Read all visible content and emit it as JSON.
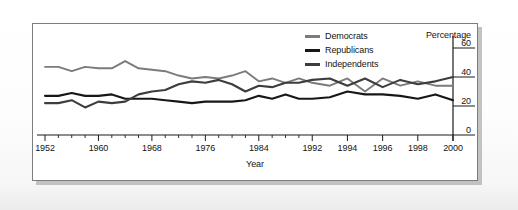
{
  "chart_data": {
    "type": "line",
    "title": "",
    "xlabel": "Year",
    "ylabel": "Percentage",
    "ylim": [
      0,
      60
    ],
    "yticks": [
      0,
      20,
      40,
      60
    ],
    "grid": false,
    "legend_position": "top-center-right",
    "x_tick_labels": [
      "1952",
      "1960",
      "1968",
      "1976",
      "1984",
      "1992",
      "1994",
      "1996",
      "1998",
      "2000"
    ],
    "x_tick_note": "Axis spacing is non-uniform: 8-year steps from 1952 to 1992, then 2-year steps from 1992 to 2000",
    "x": [
      1952,
      1954,
      1956,
      1958,
      1960,
      1962,
      1964,
      1966,
      1968,
      1970,
      1972,
      1974,
      1976,
      1978,
      1980,
      1982,
      1984,
      1986,
      1988,
      1990,
      1992,
      1993,
      1994,
      1995,
      1996,
      1997,
      1998,
      1999,
      2000
    ],
    "series": [
      {
        "name": "Democrats",
        "color": "#7b7b7b",
        "values": [
          47,
          47,
          44,
          47,
          46,
          46,
          51,
          46,
          45,
          44,
          41,
          39,
          40,
          39,
          41,
          44,
          37,
          39,
          36,
          39,
          36,
          34,
          39,
          30,
          39,
          34,
          37,
          34,
          34
        ]
      },
      {
        "name": "Republicans",
        "color": "#171717",
        "values": [
          27,
          27,
          29,
          27,
          27,
          28,
          25,
          25,
          25,
          24,
          23,
          22,
          23,
          23,
          23,
          24,
          27,
          25,
          28,
          25,
          25,
          26,
          30,
          28,
          28,
          27,
          25,
          28,
          24
        ]
      },
      {
        "name": "Independents",
        "color": "#3d3d3d",
        "values": [
          22,
          22,
          24,
          19,
          23,
          22,
          23,
          28,
          30,
          31,
          35,
          37,
          36,
          38,
          35,
          30,
          34,
          33,
          36,
          36,
          38,
          39,
          34,
          39,
          33,
          38,
          35,
          37,
          40
        ]
      }
    ]
  },
  "legend": {
    "items": [
      {
        "label": "Democrats",
        "color": "#7b7b7b"
      },
      {
        "label": "Republicans",
        "color": "#171717"
      },
      {
        "label": "Independents",
        "color": "#3d3d3d"
      }
    ]
  },
  "axes": {
    "y_title": "Percentage",
    "x_title": "Year"
  }
}
